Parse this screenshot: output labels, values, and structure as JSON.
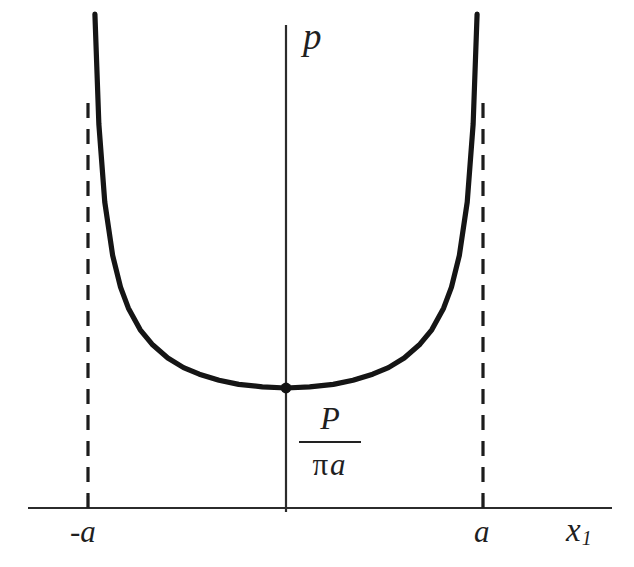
{
  "figure": {
    "background_color": "#ffffff",
    "ink_color": "#1f1f1f",
    "curve_color": "#151515"
  },
  "labels": {
    "y_axis": "p",
    "x_axis_base": "x",
    "x_axis_subscript": "1",
    "tick_left": "-a",
    "tick_right": "a",
    "minimum_numerator": "P",
    "minimum_denominator_pi": "π",
    "minimum_denominator_a": "a"
  },
  "chart_data": {
    "type": "line",
    "title": "",
    "xlabel": "x₁",
    "ylabel": "p",
    "xlim": [
      -1.25,
      1.6
    ],
    "ylim": [
      0,
      1.0
    ],
    "grid": false,
    "legend": null,
    "annotations": [
      {
        "text": "P / (π a)",
        "x": 0,
        "y": 0.2,
        "kind": "minimum-value-label",
        "placement": "below-minimum-on-axis"
      }
    ],
    "tick_labels": {
      "x": [
        "-a",
        "a"
      ],
      "x_values": [
        -1,
        1
      ],
      "y": []
    },
    "asymptotes": [
      {
        "type": "vertical",
        "x": -1,
        "style": "dashed",
        "label": "-a"
      },
      {
        "type": "vertical",
        "x": 1,
        "style": "dashed",
        "label": "a"
      }
    ],
    "markers": [
      {
        "x": 0,
        "y": 0.2,
        "label": "minimum pressure P/(π a)",
        "style": "filled-dot"
      }
    ],
    "series": [
      {
        "name": "p(x1)",
        "formula": "P / (pi * sqrt(a^2 - x1^2))",
        "x": [
          -0.97,
          -0.95,
          -0.92,
          -0.88,
          -0.84,
          -0.8,
          -0.74,
          -0.68,
          -0.6,
          -0.52,
          -0.44,
          -0.34,
          -0.24,
          -0.12,
          0.0,
          0.12,
          0.24,
          0.34,
          0.44,
          0.52,
          0.6,
          0.68,
          0.74,
          0.8,
          0.84,
          0.88,
          0.92,
          0.95,
          0.97
        ],
        "y": [
          0.823,
          0.64,
          0.51,
          0.421,
          0.368,
          0.333,
          0.297,
          0.273,
          0.25,
          0.234,
          0.223,
          0.213,
          0.206,
          0.202,
          0.2,
          0.202,
          0.206,
          0.213,
          0.223,
          0.234,
          0.25,
          0.273,
          0.297,
          0.333,
          0.368,
          0.421,
          0.51,
          0.64,
          0.823
        ]
      }
    ]
  }
}
